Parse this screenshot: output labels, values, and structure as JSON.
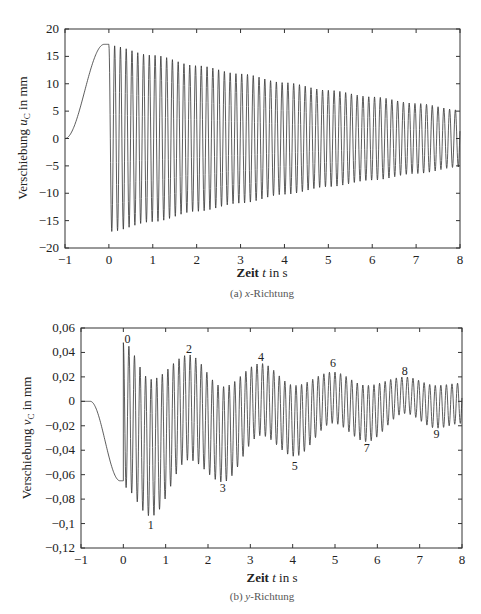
{
  "chart_data": [
    {
      "type": "line",
      "title": "",
      "caption": "(a) x-Richtung",
      "caption_prefix": "(a) ",
      "caption_var": "x",
      "caption_suffix": "-Richtung",
      "xlabel": "Zeit t in s",
      "xlabel_parts": {
        "pre": "Zeit ",
        "var": "t",
        "post": " in s"
      },
      "ylabel": "Verschiebung u_C in mm",
      "ylabel_parts": {
        "pre": "Verschiebung ",
        "var": "u",
        "sub": "C",
        "post": " in mm"
      },
      "xlim": [
        -1,
        8
      ],
      "ylim": [
        -20,
        20
      ],
      "x_ticks": [
        "-1",
        "0",
        "1",
        "2",
        "3",
        "4",
        "5",
        "6",
        "7",
        "8"
      ],
      "y_ticks": [
        "20",
        "15",
        "10",
        "5",
        "0",
        "-5",
        "-10",
        "-15",
        "-20"
      ],
      "grid": false,
      "legend": null,
      "series": [
        {
          "name": "u_C",
          "description": "Smooth rise from 0 at t=-1 to ~17.2 at t=0, then high-frequency oscillation (~7.5 Hz) symmetric about 0 with exponentially decaying envelope",
          "pre_phase": {
            "t_start": -1,
            "t_end": 0,
            "start": 0,
            "end": 17.2
          },
          "oscillation": {
            "frequency_hz": 7.6,
            "amplitude_start": 17.0,
            "amplitude_end": 5.2,
            "offset": 0
          }
        }
      ],
      "envelope_samples": {
        "t": [
          0,
          1,
          2,
          3,
          4,
          5,
          6,
          7,
          8
        ],
        "amplitude": [
          17.0,
          15.2,
          13.3,
          11.8,
          10.2,
          8.8,
          7.6,
          6.4,
          5.2
        ]
      }
    },
    {
      "type": "line",
      "title": "",
      "caption": "(b) y-Richtung",
      "caption_prefix": "(b) ",
      "caption_var": "y",
      "caption_suffix": "-Richtung",
      "xlabel": "Zeit t in s",
      "xlabel_parts": {
        "pre": "Zeit ",
        "var": "t",
        "post": " in s"
      },
      "ylabel": "Verschiebung v_C in mm",
      "ylabel_parts": {
        "pre": "Verschiebung ",
        "var": "v",
        "sub": "C",
        "post": " in mm"
      },
      "xlim": [
        -1,
        8
      ],
      "ylim": [
        -0.12,
        0.06
      ],
      "x_ticks": [
        "-1",
        "0",
        "1",
        "2",
        "3",
        "4",
        "5",
        "6",
        "7",
        "8"
      ],
      "y_ticks": [
        "0,06",
        "0,04",
        "0,02",
        "0",
        "-0,02",
        "-0,04",
        "-0,06",
        "-0,08",
        "-0,1",
        "-0,12"
      ],
      "grid": false,
      "legend": null,
      "series": [
        {
          "name": "v_C",
          "description": "Flat 0 until t≈-0.75, smooth descent to ~-0.065 at t=0, then high-frequency oscillation with beating envelope; mean drifts from ~-0.025 toward ~-0.005",
          "pre_phase": {
            "t_start": -1,
            "t_end": 0,
            "start": 0,
            "end": -0.065
          },
          "oscillation": {
            "frequency_hz": 7.6,
            "beat_period_s": 1.65
          }
        }
      ],
      "annotations": [
        {
          "label": "0",
          "t": 0.1,
          "v": 0.051,
          "kind": "max"
        },
        {
          "label": "1",
          "t": 0.65,
          "v": -0.101,
          "kind": "min"
        },
        {
          "label": "2",
          "t": 1.55,
          "v": 0.043,
          "kind": "max"
        },
        {
          "label": "3",
          "t": 2.35,
          "v": -0.071,
          "kind": "min"
        },
        {
          "label": "4",
          "t": 3.25,
          "v": 0.036,
          "kind": "max"
        },
        {
          "label": "5",
          "t": 4.05,
          "v": -0.053,
          "kind": "min"
        },
        {
          "label": "6",
          "t": 4.95,
          "v": 0.031,
          "kind": "max"
        },
        {
          "label": "7",
          "t": 5.75,
          "v": -0.038,
          "kind": "min"
        },
        {
          "label": "8",
          "t": 6.65,
          "v": 0.025,
          "kind": "max"
        },
        {
          "label": "9",
          "t": 7.4,
          "v": -0.027,
          "kind": "min"
        }
      ],
      "envelope_samples": {
        "t": [
          0,
          0.65,
          1.55,
          2.35,
          3.25,
          4.05,
          4.95,
          5.75,
          6.65,
          7.4,
          8
        ],
        "upper": [
          0.048,
          0.018,
          0.038,
          0.012,
          0.031,
          0.013,
          0.024,
          0.013,
          0.02,
          0.013,
          0.015
        ],
        "lower": [
          -0.07,
          -0.094,
          -0.048,
          -0.066,
          -0.028,
          -0.045,
          -0.018,
          -0.033,
          -0.01,
          -0.022,
          -0.018
        ]
      }
    }
  ]
}
